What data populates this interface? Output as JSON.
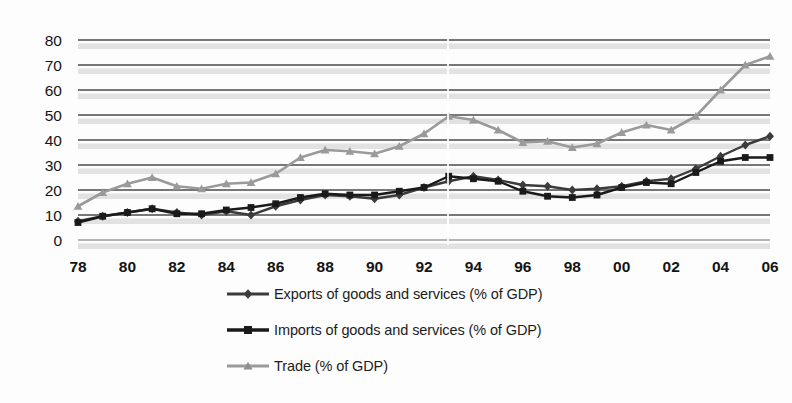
{
  "chart_data": {
    "type": "line",
    "title": "",
    "subtitle": "",
    "xlabel": "",
    "ylabel": "",
    "x": [
      1978,
      1979,
      1980,
      1981,
      1982,
      1983,
      1984,
      1985,
      1986,
      1987,
      1988,
      1989,
      1990,
      1991,
      1992,
      1993,
      1994,
      1995,
      1996,
      1997,
      1998,
      1999,
      2000,
      2001,
      2002,
      2003,
      2004,
      2005,
      2006
    ],
    "tick_labels": [
      "78",
      "",
      "80",
      "",
      "82",
      "",
      "84",
      "",
      "86",
      "",
      "88",
      "",
      "90",
      "",
      "92",
      "",
      "94",
      "",
      "96",
      "",
      "98",
      "",
      "00",
      "",
      "02",
      "",
      "04",
      "",
      "06"
    ],
    "visible_xticks": [
      "78",
      "80",
      "82",
      "84",
      "86",
      "88",
      "90",
      "92",
      "94",
      "96",
      "98",
      "00",
      "02",
      "04",
      "06"
    ],
    "yticks": [
      0,
      10,
      20,
      30,
      40,
      50,
      60,
      70,
      80
    ],
    "ylim": [
      0,
      80
    ],
    "xlim": [
      1978,
      2006
    ],
    "grid": true,
    "grid_orientation": "horizontal",
    "legend_position": "bottom-center",
    "series": [
      {
        "name": "Exports of goods and services (% of GDP)",
        "color": "#3b3b3b",
        "marker": "diamond",
        "values": [
          7.5,
          9.5,
          11.0,
          12.5,
          11.0,
          10.0,
          11.5,
          10.0,
          13.5,
          16.0,
          18.0,
          17.5,
          16.5,
          18.0,
          21.0,
          23.5,
          25.5,
          24.0,
          22.0,
          21.5,
          20.0,
          20.5,
          21.5,
          23.5,
          24.5,
          28.5,
          33.5,
          38.0,
          41.5
        ]
      },
      {
        "name": "Imports of goods and services (% of GDP)",
        "color": "#1a1a1a",
        "marker": "square",
        "values": [
          7.0,
          9.5,
          11.0,
          12.5,
          10.5,
          10.5,
          12.0,
          13.0,
          14.5,
          17.0,
          18.5,
          18.0,
          18.0,
          19.5,
          21.0,
          25.5,
          24.5,
          23.5,
          19.5,
          17.5,
          17.0,
          18.0,
          21.0,
          23.0,
          22.5,
          27.0,
          31.5,
          33.0,
          33.0
        ]
      },
      {
        "name": "Trade (% of GDP)",
        "color": "#9a9a9a",
        "marker": "triangle",
        "values": [
          13.5,
          19.0,
          22.5,
          25.0,
          21.5,
          20.5,
          22.5,
          23.0,
          26.5,
          33.0,
          36.0,
          35.5,
          34.5,
          37.5,
          42.5,
          49.5,
          48.0,
          44.0,
          39.0,
          39.5,
          37.0,
          38.5,
          43.0,
          46.0,
          44.0,
          49.5,
          60.0,
          70.0,
          73.5
        ]
      }
    ]
  },
  "legend": {
    "items": [
      {
        "label": "Exports of goods and services (% of GDP)",
        "marker": "diamond",
        "color": "#3b3b3b"
      },
      {
        "label": "Imports of goods and services (% of GDP)",
        "marker": "square",
        "color": "#1a1a1a"
      },
      {
        "label": "Trade (% of GDP)",
        "marker": "triangle",
        "color": "#9a9a9a"
      }
    ]
  },
  "colors": {
    "background": "#fdfdfd",
    "gridline": "#4a4a4a",
    "gridline_shadow": "#d8d8d8",
    "axis_text": "#141414",
    "exports": "#3b3b3b",
    "imports": "#1a1a1a",
    "trade": "#9a9a9a"
  }
}
